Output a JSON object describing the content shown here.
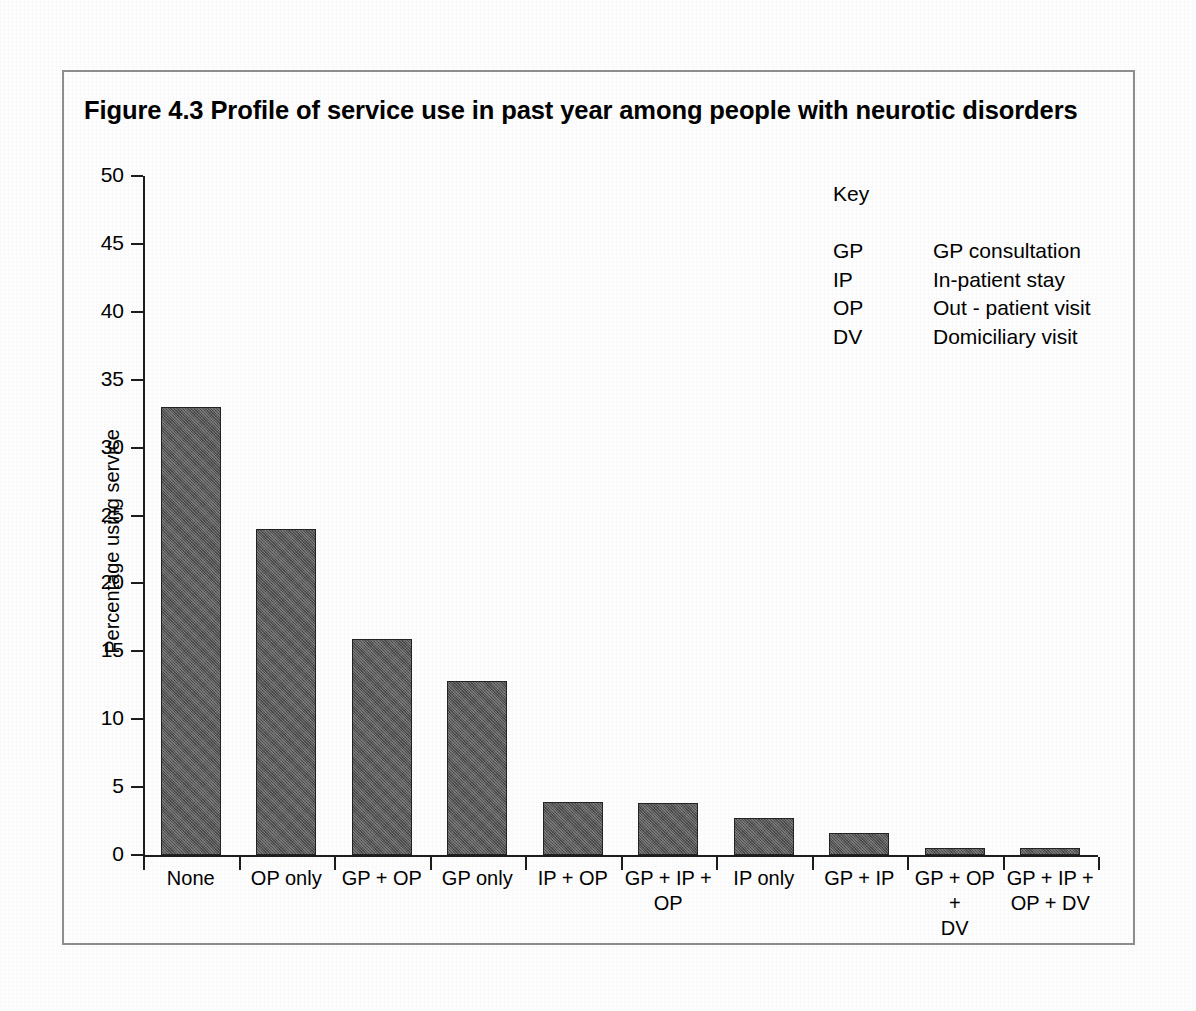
{
  "figure": {
    "title": "Figure 4.3  Profile of service use in past year among people with neurotic disorders",
    "frame_color": "#8d8d8d",
    "bar_color": "#565656",
    "axis_color": "#1c1c1c"
  },
  "key": {
    "heading": "Key",
    "entries": [
      {
        "abbr": "GP",
        "description": "GP consultation"
      },
      {
        "abbr": "IP",
        "description": "In-patient stay"
      },
      {
        "abbr": "OP",
        "description": "Out - patient visit"
      },
      {
        "abbr": "DV",
        "description": "Domiciliary visit"
      }
    ]
  },
  "chart_data": {
    "type": "bar",
    "title": "Figure 4.3  Profile of service use in past year among people with neurotic disorders",
    "xlabel": "",
    "ylabel": "Percentage using service",
    "ylim": [
      0,
      50
    ],
    "yticks": [
      0,
      5,
      10,
      15,
      20,
      25,
      30,
      35,
      40,
      45,
      50
    ],
    "ytick_labels": [
      "0",
      "5",
      "10",
      "15",
      "20",
      "25",
      "30",
      "35",
      "40",
      "45",
      "50"
    ],
    "grid": false,
    "legend": "none",
    "categories": [
      "None",
      "OP only",
      "GP + OP",
      "GP only",
      "IP + OP",
      "GP + IP + OP",
      "IP only",
      "GP + IP",
      "GP + OP + DV",
      "GP + IP + OP + DV"
    ],
    "category_label_lines": [
      [
        "None"
      ],
      [
        "OP only"
      ],
      [
        "GP + OP"
      ],
      [
        "GP only"
      ],
      [
        "IP + OP"
      ],
      [
        "GP + IP +",
        "OP"
      ],
      [
        "IP only"
      ],
      [
        "GP + IP"
      ],
      [
        "GP + OP +",
        "DV"
      ],
      [
        "GP + IP +",
        "OP + DV"
      ]
    ],
    "values": [
      33.0,
      24.0,
      15.9,
      12.8,
      3.9,
      3.8,
      2.7,
      1.6,
      0.55,
      0.5
    ]
  }
}
